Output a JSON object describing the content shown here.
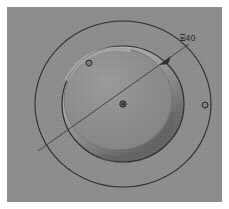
{
  "view": {
    "title": "CAD circular bore detail view",
    "background_color": "#ffffff",
    "plate_color": "#8d8d8d",
    "line_color": "#2b2b2b",
    "bore_fill_color": "#8a8a8a",
    "bore_highlight_color": "#a6a6a6",
    "bore_shadow_color": "#6b6b6b",
    "plate_width_px": 215,
    "plate_height_px": 195
  },
  "annotations": {
    "diameter_dimension": {
      "label": "⌸40",
      "symbol": "⌸",
      "value": "40",
      "x_px": 180,
      "y_px": 31
    }
  },
  "geometry": {
    "center": {
      "cx": 116,
      "cy": 97
    },
    "outer_circle": {
      "name": "outer-boss-circle",
      "rx": 88,
      "ry": 83,
      "stroke": "#2b2b2b",
      "stroke_width": 1.1
    },
    "middle_circle": {
      "name": "bore-outer-circle",
      "rx": 61,
      "ry": 58,
      "stroke": "#2b2b2b",
      "stroke_width": 1.1
    },
    "inner_circle": {
      "name": "bore-inner-circle",
      "rx": 55,
      "ry": 52,
      "stroke": "#5a5a5a",
      "stroke_width": 0.8
    },
    "leader_line": {
      "name": "diameter-leader-line",
      "x1": 31,
      "y1": 144,
      "x2": 182,
      "y2": 37,
      "stroke": "#3a3a3a",
      "stroke_width": 0.9
    },
    "arrowhead": {
      "name": "leader-arrowhead",
      "x": 158,
      "y": 54
    },
    "center_mark": {
      "name": "center-point-marker",
      "cx": 116,
      "cy": 97,
      "r": 3.2
    },
    "point_markers": [
      {
        "name": "point-marker-upper-left",
        "cx": 82,
        "cy": 56,
        "r": 3.0
      },
      {
        "name": "point-marker-right-edge",
        "cx": 198,
        "cy": 98,
        "r": 3.0
      }
    ]
  }
}
